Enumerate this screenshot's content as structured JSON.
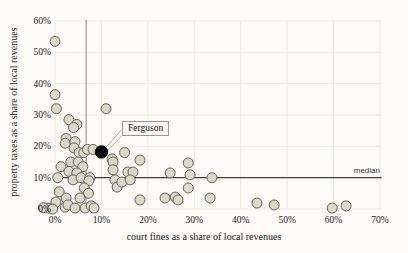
{
  "chart_data": {
    "type": "scatter",
    "xlabel": "court fines as a share of local revenues",
    "ylabel": "property taxes as a share of local revenues",
    "xlim": [
      0,
      70
    ],
    "ylim": [
      0,
      60
    ],
    "grid": true,
    "x_ticks": [
      {
        "v": 0,
        "label": "0%"
      },
      {
        "v": 10,
        "label": "10%"
      },
      {
        "v": 20,
        "label": "20%"
      },
      {
        "v": 30,
        "label": "30%"
      },
      {
        "v": 40,
        "label": "40%"
      },
      {
        "v": 50,
        "label": "50%"
      },
      {
        "v": 60,
        "label": "60%"
      },
      {
        "v": 70,
        "label": "70%"
      }
    ],
    "y_ticks": [
      {
        "v": 0,
        "label": "0%"
      },
      {
        "v": 10,
        "label": "10%"
      },
      {
        "v": 20,
        "label": "20%"
      },
      {
        "v": 30,
        "label": "30%"
      },
      {
        "v": 40,
        "label": "40%"
      },
      {
        "v": 50,
        "label": "50%"
      },
      {
        "v": 60,
        "label": "60%"
      }
    ],
    "points": [
      [
        0,
        53.5
      ],
      [
        0,
        36.5
      ],
      [
        0.3,
        32
      ],
      [
        11,
        32
      ],
      [
        3,
        28.5
      ],
      [
        4.7,
        27
      ],
      [
        4,
        26
      ],
      [
        2.4,
        22.5
      ],
      [
        2.2,
        21
      ],
      [
        4.3,
        21.5
      ],
      [
        4.1,
        19.5
      ],
      [
        5.2,
        18
      ],
      [
        6.2,
        18
      ],
      [
        7,
        19
      ],
      [
        8.2,
        19
      ],
      [
        12.3,
        16
      ],
      [
        12.5,
        15
      ],
      [
        15,
        18
      ],
      [
        3.4,
        15
      ],
      [
        5,
        15
      ],
      [
        1.3,
        13.5
      ],
      [
        6,
        13.5
      ],
      [
        3,
        12
      ],
      [
        4.7,
        11.5
      ],
      [
        0.6,
        10
      ],
      [
        3.9,
        9.3
      ],
      [
        5.6,
        10
      ],
      [
        7.5,
        10
      ],
      [
        7.3,
        9
      ],
      [
        0.9,
        5.5
      ],
      [
        6.3,
        6.7
      ],
      [
        7.2,
        5
      ],
      [
        2.4,
        3.5
      ],
      [
        5.4,
        3.5
      ],
      [
        0.2,
        2.2
      ],
      [
        -1.3,
        0.3
      ],
      [
        -2.5,
        0.4
      ],
      [
        -0.5,
        0
      ],
      [
        2.2,
        0.6
      ],
      [
        2.8,
        1.3
      ],
      [
        4.3,
        0.3
      ],
      [
        6.5,
        0.3
      ],
      [
        7.8,
        1
      ],
      [
        8.4,
        0.3
      ],
      [
        12.5,
        12.5
      ],
      [
        12.9,
        9.3
      ],
      [
        13.4,
        7
      ],
      [
        14.4,
        8.6
      ],
      [
        15.7,
        11.8
      ],
      [
        16.8,
        11.8
      ],
      [
        16.2,
        9.3
      ],
      [
        18.3,
        15.6
      ],
      [
        18.3,
        2.9
      ],
      [
        23.7,
        3.5
      ],
      [
        25.9,
        3.8
      ],
      [
        24.8,
        11.5
      ],
      [
        28.7,
        14.7
      ],
      [
        29.1,
        10.9
      ],
      [
        28.7,
        6.7
      ],
      [
        26.5,
        2.9
      ],
      [
        33.8,
        10
      ],
      [
        33.4,
        3.5
      ],
      [
        43.5,
        1.9
      ],
      [
        47.2,
        1.3
      ],
      [
        59.7,
        0.3
      ],
      [
        62.7,
        1
      ]
    ],
    "highlight_point": {
      "label": "Ferguson",
      "x": 10,
      "y": 18.2
    },
    "median_line": {
      "label": "median",
      "y": 10
    },
    "vertical_line": {
      "x": 6.7
    },
    "legend_position": "none",
    "colors": {
      "point_fill": "#dbd8cc",
      "point_stroke": "#62625a",
      "highlight_fill": "#000000",
      "grid": "#ebe8df",
      "median_line": "#3f3f3a",
      "vertical_line": "#83837b",
      "callout": "#b8b5a9",
      "background": "#fcfbf7",
      "text": "#1a1a1a"
    }
  }
}
